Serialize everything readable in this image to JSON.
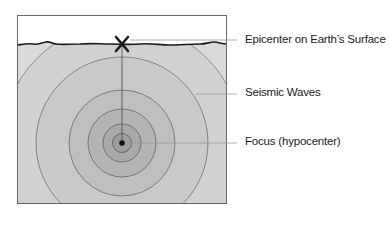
{
  "diagram": {
    "labels": {
      "epicenter": "Epicenter on Earth’s Surface",
      "waves": "Seismic Waves",
      "focus": "Focus (hypocenter)"
    },
    "colors": {
      "sky": "#ffffff",
      "ground_outer": "#d6d6d6",
      "ring_1": "#cfcfcf",
      "ring_2": "#c5c5c5",
      "ring_3": "#bcbcbc",
      "ring_4": "#b2b2b2",
      "ring_5": "#a6a6a6",
      "focus_dot": "#111111",
      "stroke": "#6e6e6e"
    },
    "wave_rings_count": 6
  }
}
